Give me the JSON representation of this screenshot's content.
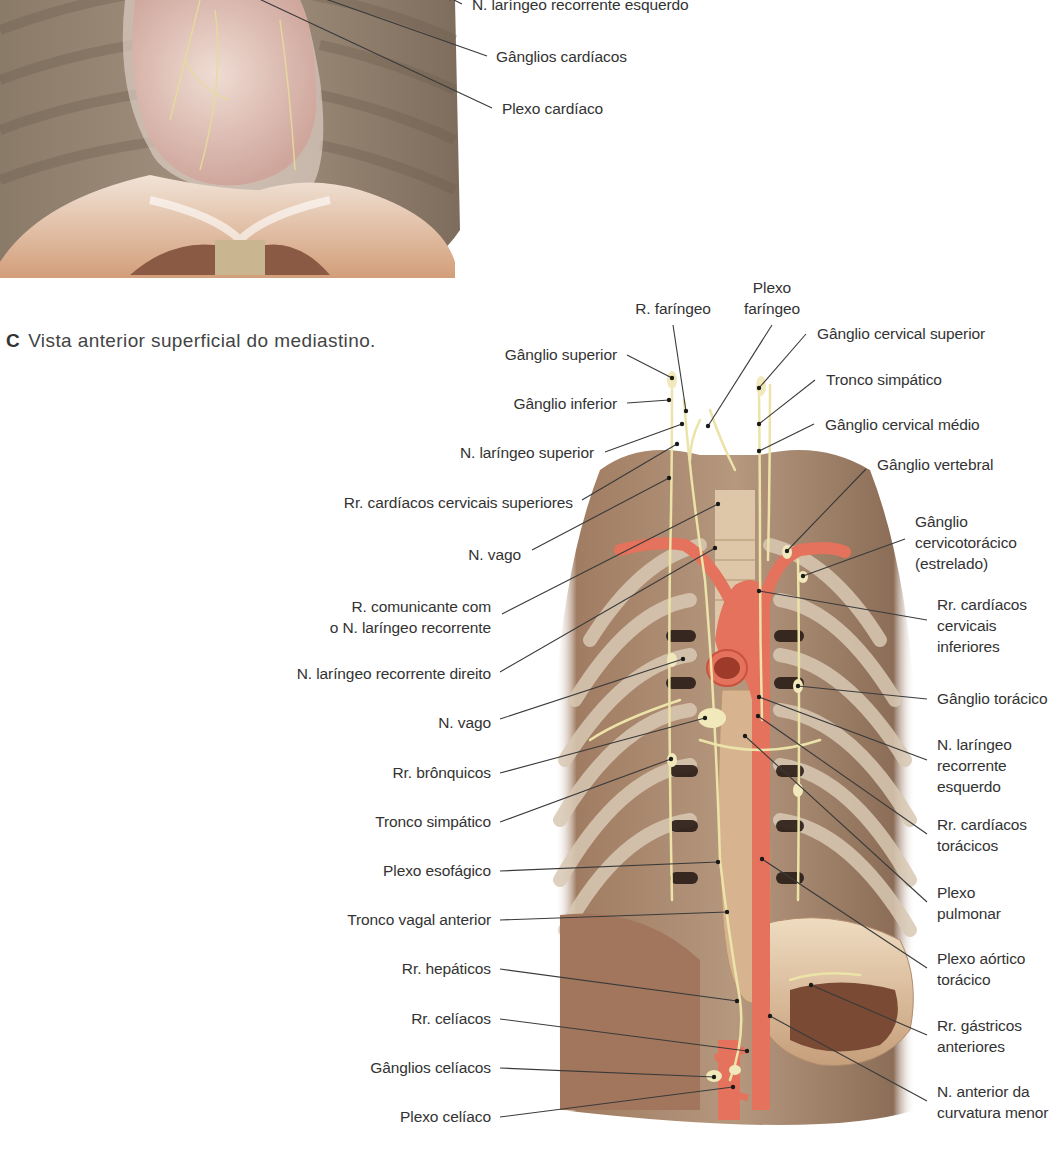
{
  "figure_top": {
    "labels": [
      {
        "id": "n-laringeo-recorrente-esquerdo-top",
        "text": "N. laríngeo recorrente esquerdo",
        "x": 472,
        "y": -6,
        "align": "l",
        "line": [
          [
            462,
            4
          ],
          [
            450,
            -2
          ]
        ]
      },
      {
        "id": "ganglios-cardiacos",
        "text": "Gânglios cardíacos",
        "x": 496,
        "y": 46,
        "align": "l",
        "line": [
          [
            487,
            56
          ],
          [
            300,
            -10
          ]
        ]
      },
      {
        "id": "plexo-cardiaco",
        "text": "Plexo cardíaco",
        "x": 502,
        "y": 98,
        "align": "l",
        "line": [
          [
            492,
            108
          ],
          [
            240,
            -10
          ]
        ]
      }
    ]
  },
  "caption": {
    "letter": "C",
    "text": "Vista anterior superficial do mediastino."
  },
  "figure_c": {
    "left_labels": [
      {
        "id": "ganglio-superior",
        "text": "Gânglio superior",
        "x": 617,
        "y": 344,
        "line": [
          [
            627,
            355
          ],
          [
            672,
            378
          ]
        ]
      },
      {
        "id": "ganglio-inferior",
        "text": "Gânglio inferior",
        "x": 617,
        "y": 393,
        "line": [
          [
            627,
            403
          ],
          [
            669,
            400
          ]
        ]
      },
      {
        "id": "n-laringeo-superior",
        "text": "N. laríngeo superior",
        "x": 594,
        "y": 442,
        "line": [
          [
            605,
            452
          ],
          [
            682,
            424
          ]
        ]
      },
      {
        "id": "rr-cardiacos-cervicais-superiores",
        "text": "Rr. cardíacos cervicais superiores",
        "x": 573,
        "y": 492,
        "line": [
          [
            582,
            500
          ],
          [
            677,
            444
          ]
        ]
      },
      {
        "id": "n-vago-1",
        "text": "N. vago",
        "x": 521,
        "y": 544,
        "line": [
          [
            532,
            550
          ],
          [
            669,
            478
          ]
        ]
      },
      {
        "id": "r-comunicante",
        "text": "R. comunicante com\no N. laríngeo recorrente",
        "x": 491,
        "y": 596,
        "line": [
          [
            502,
            614
          ],
          [
            718,
            504
          ]
        ]
      },
      {
        "id": "n-laringeo-recorrente-direito",
        "text": "N. laríngeo recorrente direito",
        "x": 491,
        "y": 663,
        "line": [
          [
            500,
            672
          ],
          [
            715,
            548
          ]
        ]
      },
      {
        "id": "n-vago-2",
        "text": "N. vago",
        "x": 491,
        "y": 712,
        "line": [
          [
            500,
            719
          ],
          [
            683,
            659
          ]
        ]
      },
      {
        "id": "rr-bronquicos",
        "text": "Rr. brônquicos",
        "x": 491,
        "y": 762,
        "line": [
          [
            500,
            773
          ],
          [
            705,
            718
          ]
        ]
      },
      {
        "id": "tronco-simpatico-esq",
        "text": "Tronco simpático",
        "x": 491,
        "y": 811,
        "line": [
          [
            500,
            822
          ],
          [
            671,
            759
          ]
        ]
      },
      {
        "id": "plexo-esofagico",
        "text": "Plexo esofágico",
        "x": 491,
        "y": 860,
        "line": [
          [
            500,
            871
          ],
          [
            718,
            862
          ]
        ]
      },
      {
        "id": "tronco-vagal-anterior",
        "text": "Tronco vagal anterior",
        "x": 491,
        "y": 909,
        "line": [
          [
            500,
            920
          ],
          [
            727,
            912
          ]
        ]
      },
      {
        "id": "rr-hepaticos",
        "text": "Rr. hepáticos",
        "x": 491,
        "y": 958,
        "line": [
          [
            500,
            969
          ],
          [
            737,
            1001
          ]
        ]
      },
      {
        "id": "rr-celiacos",
        "text": "Rr. celíacos",
        "x": 491,
        "y": 1008,
        "line": [
          [
            500,
            1019
          ],
          [
            747,
            1051
          ]
        ]
      },
      {
        "id": "ganglios-celiacos",
        "text": "Gânglios celíacos",
        "x": 491,
        "y": 1057,
        "line": [
          [
            500,
            1068
          ],
          [
            714,
            1077
          ]
        ]
      },
      {
        "id": "plexo-celiaco",
        "text": "Plexo celíaco",
        "x": 491,
        "y": 1106,
        "line": [
          [
            500,
            1117
          ],
          [
            733,
            1087
          ]
        ]
      }
    ],
    "top_labels": [
      {
        "id": "r-faringeo",
        "text": "R. faríngeo",
        "x": 673,
        "y": 298,
        "line": [
          [
            673,
            325
          ],
          [
            686,
            411
          ]
        ]
      },
      {
        "id": "plexo-faringeo",
        "text": "Plexo\nfaríngeo",
        "x": 772,
        "y": 277,
        "line": [
          [
            772,
            325
          ],
          [
            708,
            426
          ]
        ]
      }
    ],
    "right_labels": [
      {
        "id": "ganglio-cervical-superior",
        "text": "Gânglio cervical superior",
        "x": 817,
        "y": 323,
        "line": [
          [
            806,
            334
          ],
          [
            759,
            388
          ]
        ]
      },
      {
        "id": "tronco-simpatico-dir",
        "text": "Tronco simpático",
        "x": 826,
        "y": 369,
        "line": [
          [
            815,
            380
          ],
          [
            759,
            424
          ]
        ]
      },
      {
        "id": "ganglio-cervical-medio",
        "text": "Gânglio cervical médio",
        "x": 825,
        "y": 414,
        "line": [
          [
            814,
            424
          ],
          [
            759,
            451
          ]
        ]
      },
      {
        "id": "ganglio-vertebral",
        "text": "Gânglio vertebral",
        "x": 877,
        "y": 454,
        "line": [
          [
            866,
            469
          ],
          [
            787,
            551
          ]
        ]
      },
      {
        "id": "ganglio-cervicotoracico",
        "text": "Gânglio\ncervicotorácico\n(estrelado)",
        "x": 915,
        "y": 511,
        "line": [
          [
            905,
            539
          ],
          [
            803,
            576
          ]
        ]
      },
      {
        "id": "rr-cardiacos-cervicais-inferiores",
        "text": "Rr. cardíacos\ncervicais\ninferiores",
        "x": 937,
        "y": 594,
        "line": [
          [
            927,
            620
          ],
          [
            759,
            591
          ]
        ]
      },
      {
        "id": "ganglio-toracico",
        "text": "Gânglio torácico",
        "x": 937,
        "y": 688,
        "line": [
          [
            927,
            699
          ],
          [
            798,
            686
          ]
        ]
      },
      {
        "id": "n-laringeo-recorrente-esquerdo",
        "text": "N. laríngeo\nrecorrente\nesquerdo",
        "x": 937,
        "y": 734,
        "line": [
          [
            927,
            760
          ],
          [
            759,
            697
          ]
        ]
      },
      {
        "id": "rr-cardiacos-toracicos",
        "text": "Rr. cardíacos\ntorácicos",
        "x": 937,
        "y": 814,
        "line": [
          [
            927,
            834
          ],
          [
            758,
            716
          ]
        ]
      },
      {
        "id": "plexo-pulmonar",
        "text": "Plexo\npulmonar",
        "x": 937,
        "y": 882,
        "line": [
          [
            927,
            902
          ],
          [
            745,
            736
          ]
        ]
      },
      {
        "id": "plexo-aortico-toracico",
        "text": "Plexo aórtico\ntorácico",
        "x": 937,
        "y": 948,
        "line": [
          [
            927,
            968
          ],
          [
            762,
            859
          ]
        ]
      },
      {
        "id": "rr-gastricos-anteriores",
        "text": "Rr. gástricos\nanteriores",
        "x": 937,
        "y": 1015,
        "line": [
          [
            927,
            1035
          ],
          [
            811,
            985
          ]
        ]
      },
      {
        "id": "n-anterior-curvatura-menor",
        "text": "N. anterior da\ncurvatura menor",
        "x": 937,
        "y": 1081,
        "line": [
          [
            927,
            1101
          ],
          [
            770,
            1016
          ]
        ]
      }
    ]
  },
  "colors": {
    "label_text": "#333333",
    "leader_line": "#3a3a3a",
    "nerve": "#e8dfa8",
    "artery": "#e4725c",
    "muscle": "#b9876a",
    "rib": "#8e7b66"
  }
}
